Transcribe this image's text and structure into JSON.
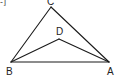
{
  "figure": {
    "type": "geometry-triangle-with-interior-point",
    "stroke_color": "#1a1a1a",
    "corner_fragment": "-]",
    "points": {
      "A": {
        "label": "A",
        "x": 109,
        "y": 62,
        "label_x": 107,
        "label_y": 75
      },
      "B": {
        "label": "B",
        "x": 11,
        "y": 62,
        "label_x": 6,
        "label_y": 75
      },
      "C": {
        "label": "C",
        "x": 51,
        "y": 7,
        "label_x": 47,
        "label_y": 5
      },
      "D": {
        "label": "D",
        "x": 59,
        "y": 39,
        "label_x": 56,
        "label_y": 35
      }
    },
    "segments": [
      [
        "A",
        "B"
      ],
      [
        "B",
        "C"
      ],
      [
        "C",
        "A"
      ],
      [
        "B",
        "D"
      ],
      [
        "D",
        "A"
      ]
    ]
  }
}
